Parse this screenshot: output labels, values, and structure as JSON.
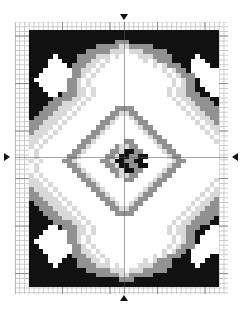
{
  "document": {
    "kind": "needlepoint-pattern-chart",
    "title": "Needlepoint Medallion Pattern Chart"
  },
  "grid": {
    "columns": 40,
    "rows": 54,
    "cell_size_px": 4.75,
    "minor_line_color": "#c9c9c9",
    "major_line_color": "#8e8e8e",
    "major_line_every": 10,
    "paper_color": "#ffffff"
  },
  "palette": {
    "0": "#ffffff",
    "1": "#d9d9d9",
    "2": "#919191",
    "3": "#111111",
    "legend": [
      {
        "key": "0",
        "name": "white",
        "color": "#ffffff"
      },
      {
        "key": "1",
        "name": "light-gray",
        "color": "#d9d9d9"
      },
      {
        "key": "2",
        "name": "mid-gray",
        "color": "#919191"
      },
      {
        "key": "3",
        "name": "black",
        "color": "#111111"
      }
    ]
  },
  "markers": {
    "top": {
      "name": "center-marker-top",
      "glyph": "triangle-down",
      "color": "#111111",
      "column": 20
    },
    "bottom": {
      "name": "center-marker-bottom",
      "glyph": "triangle-up",
      "color": "#111111",
      "column": 20
    },
    "left": {
      "name": "center-marker-left",
      "glyph": "triangle-right",
      "color": "#111111",
      "row": 27
    },
    "right": {
      "name": "center-marker-right",
      "glyph": "triangle-left",
      "color": "#111111",
      "row": 27
    }
  },
  "chart_data": {
    "type": "heatmap",
    "xlabel": "",
    "ylabel": "",
    "grid": true,
    "legend_position": "none",
    "value_labels": {
      "0": "white",
      "1": "light gray",
      "2": "mid gray",
      "3": "black"
    },
    "ncols": 40,
    "nrows": 54,
    "rows": [
      "3333333333333333333333333333333333333333",
      "3333333333333333333333333333333333333333",
      "3333333333333333332223333333333333333333",
      "3333333333333322222112222233333333333333",
      "3333333333332222211101112222233333333333",
      "3333303333222211101000011122223333303333",
      "3333000333222110100000001012223333000333",
      "3333000032221101000000000010122233000033",
      "3330000002211010000000000000101223000000",
      "3300000002210100000000000000010122200000",
      "3000000022101000000000000000001012230000",
      "3300000022101000000000000000001012230000",
      "3330000022110100000000000000010112233000",
      "3333003222110100000000000000010112223300",
      "3333322221101000000000000000001011222233",
      "3333222111010000000000000000000101122223",
      "3332221110100000002222000000000010112222",
      "3322211101000000022112200000000001011222",
      "3222111010000000221001220000000000101122",
      "2221110100000002210000122000000000010112",
      "2211101000000022100000012200000000001011",
      "2111010000000221000000001220000000000101",
      "1110100000002210000000000122000000000010",
      "1101000000022100000022000012200000000001",
      "1010000000221000002112200001220000000000",
      "0100000002210000022133220000122000000000",
      "0100000022100000221332233000012200000000",
      "1010000221000002213322330000001220000000",
      "0100000022100000221332233000012200000000",
      "0100000002210000022133220000122000000000",
      "1010000000221000002112200001220000000000",
      "1101000000022100000022000012200000000001",
      "1110100000002210000000000122000000000010",
      "2111010000000221000000001220000000000101",
      "2211101000000022100000012200000000001011",
      "2221110100000002210000122000000000010112",
      "3222111010000000221001220000000000101122",
      "3322211101000000022112200000000001011222",
      "3332221110100000002222000000000010112222",
      "3333222111010000000000000000000101122223",
      "3333322221101000000000000000001011222233",
      "3333003222110100000000000000010112223300",
      "3330000022110100000000000000010112233000",
      "3300000022101000000000000000001012230000",
      "3000000022101000000000000000001012230000",
      "3300000002210100000000000000010122200000",
      "3330000002211010000000000000101223000000",
      "3333000032221101000000000010122233000033",
      "3333000333222110100000001012223333000333",
      "3333303333222211101000011122223333303333",
      "3333333333332222211101112222233333333333",
      "3333333333333322222112222233333333333333",
      "3333333333333333333222333333333333333333",
      "3333333333333333333333333333333333333333"
    ]
  }
}
